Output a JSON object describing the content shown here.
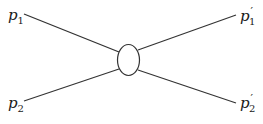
{
  "diagram": {
    "type": "scattering-vertex",
    "labels": {
      "in1": {
        "base": "p",
        "sub": "1",
        "prime": ""
      },
      "in2": {
        "base": "p",
        "sub": "2",
        "prime": ""
      },
      "out1": {
        "base": "p",
        "sub": "1",
        "prime": "′"
      },
      "out2": {
        "base": "p",
        "sub": "2",
        "prime": "′"
      }
    },
    "line_color": "#333333",
    "vertex": {
      "shape": "ellipse"
    }
  }
}
